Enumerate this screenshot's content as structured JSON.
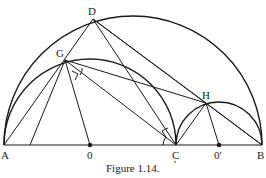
{
  "figure": {
    "caption": "Figure 1.14.",
    "caption_mark": "'",
    "points": {
      "A": {
        "label": "A",
        "x": 4,
        "y": 145
      },
      "O": {
        "label": "0",
        "x": 90,
        "y": 145
      },
      "C": {
        "label": "C",
        "x": 176,
        "y": 145
      },
      "O_prime": {
        "label": "0′",
        "x": 219,
        "y": 145
      },
      "B": {
        "label": "B",
        "x": 262,
        "y": 145
      },
      "D": {
        "label": "D",
        "x": 93,
        "y": 19
      },
      "G": {
        "label": "G",
        "x": 65,
        "y": 60
      },
      "H": {
        "label": "H",
        "x": 206,
        "y": 103
      }
    },
    "semicircles": [
      {
        "name": "large-AB",
        "cx": 133,
        "r": 129
      },
      {
        "name": "AC",
        "cx": 90,
        "r": 86
      },
      {
        "name": "CB",
        "cx": 219,
        "r": 43
      }
    ]
  }
}
